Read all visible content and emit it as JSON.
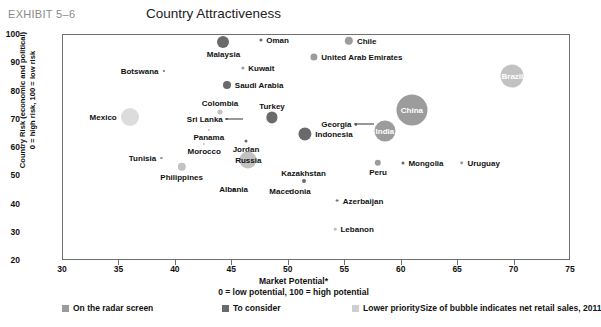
{
  "header": {
    "exhibit_id": "EXHIBIT 5–6",
    "title": "Country Attractiveness"
  },
  "chart_data": {
    "type": "scatter",
    "title": "Country Attractiveness",
    "xlabel": "Market Potential*",
    "xlabel_sub": "0 = low potential, 100 = high potential",
    "ylabel": "Country Risk (economic and political)",
    "ylabel_sub": "0 = high risk, 100 = low risk",
    "xlim": [
      30,
      75
    ],
    "ylim": [
      20,
      100
    ],
    "xticks": [
      30,
      35,
      40,
      45,
      50,
      55,
      60,
      65,
      70,
      75
    ],
    "yticks": [
      20,
      30,
      40,
      50,
      60,
      70,
      80,
      90,
      100
    ],
    "grid": false,
    "size_note": "Size of bubble indicates net retail sales, 2011",
    "legend": {
      "position": "bottom",
      "entries": [
        {
          "label": "On the radar screen",
          "color": "#9c9c9c"
        },
        {
          "label": "To consider",
          "color": "#6a6a6a"
        },
        {
          "label": "Lower priority",
          "color": "#cfcfcf"
        }
      ]
    },
    "points": [
      {
        "name": "Malaysia",
        "x": 44.3,
        "y": 97.0,
        "r": 6.0,
        "color": "#6a6a6a",
        "label_pos": "below",
        "label_inside": false
      },
      {
        "name": "Oman",
        "x": 47.6,
        "y": 97.8,
        "r": 1.6,
        "color": "#6a6a6a",
        "label_pos": "right",
        "label_inside": false
      },
      {
        "name": "Chile",
        "x": 55.4,
        "y": 97.5,
        "r": 4.2,
        "color": "#9c9c9c",
        "label_pos": "right",
        "label_inside": false
      },
      {
        "name": "United Arab Emirates",
        "x": 52.3,
        "y": 92.0,
        "r": 3.6,
        "color": "#9c9c9c",
        "label_pos": "right",
        "label_inside": false
      },
      {
        "name": "Kuwait",
        "x": 46.0,
        "y": 88.0,
        "r": 1.6,
        "color": "#9c9c9c",
        "label_pos": "right",
        "label_inside": false
      },
      {
        "name": "Botswana",
        "x": 39.0,
        "y": 86.8,
        "r": 1.1,
        "color": "#6a6a6a",
        "label_pos": "left",
        "label_inside": false
      },
      {
        "name": "Brazil",
        "x": 69.9,
        "y": 85.0,
        "r": 11.5,
        "color": "#c2c2c2",
        "label_pos": "center",
        "label_inside": true
      },
      {
        "name": "Saudi Arabia",
        "x": 44.6,
        "y": 82.0,
        "r": 4.0,
        "color": "#6a6a6a",
        "label_pos": "right",
        "label_inside": false
      },
      {
        "name": "Colombia",
        "x": 44.0,
        "y": 72.5,
        "r": 2.6,
        "color": "#c2c2c2",
        "label_pos": "above",
        "label_inside": false
      },
      {
        "name": "Mexico",
        "x": 36.0,
        "y": 70.5,
        "r": 9.0,
        "color": "#dcdcdc",
        "label_pos": "left",
        "label_inside": false
      },
      {
        "name": "Turkey",
        "x": 48.6,
        "y": 70.5,
        "r": 5.6,
        "color": "#6a6a6a",
        "label_pos": "above",
        "label_inside": false
      },
      {
        "name": "China",
        "x": 61.0,
        "y": 73.0,
        "r": 15.5,
        "color": "#9c9c9c",
        "label_pos": "center",
        "label_inside": true
      },
      {
        "name": "India",
        "x": 58.6,
        "y": 65.5,
        "r": 10.5,
        "color": "#9c9c9c",
        "label_pos": "center",
        "label_inside": true
      },
      {
        "name": "Sri Lanka",
        "x": 44.6,
        "y": 70.0,
        "r": 0.0,
        "color": "#6a6a6a",
        "label_pos": "leader",
        "label_inside": false
      },
      {
        "name": "Georgia",
        "x": 56.0,
        "y": 68.0,
        "r": 0.0,
        "color": "#6a6a6a",
        "label_pos": "leader",
        "label_inside": false
      },
      {
        "name": "Panama",
        "x": 43.0,
        "y": 66.0,
        "r": 0.0,
        "color": "#c2c2c2",
        "label_pos": "below",
        "label_inside": false
      },
      {
        "name": "Indonesia",
        "x": 51.5,
        "y": 64.5,
        "r": 6.6,
        "color": "#6a6a6a",
        "label_pos": "right",
        "label_inside": false
      },
      {
        "name": "Jordan",
        "x": 46.3,
        "y": 62.0,
        "r": 1.5,
        "color": "#6a6a6a",
        "label_pos": "below",
        "label_inside": false
      },
      {
        "name": "Morocco",
        "x": 42.6,
        "y": 61.0,
        "r": 0.0,
        "color": "#c2c2c2",
        "label_pos": "below",
        "label_inside": false
      },
      {
        "name": "Tunisia",
        "x": 38.8,
        "y": 56.0,
        "r": 1.1,
        "color": "#9c9c9c",
        "label_pos": "left",
        "label_inside": false
      },
      {
        "name": "Russia",
        "x": 46.5,
        "y": 55.5,
        "r": 8.6,
        "color": "#c2c2c2",
        "label_pos": "center",
        "label_inside": false
      },
      {
        "name": "Peru",
        "x": 58.0,
        "y": 54.5,
        "r": 3.2,
        "color": "#9c9c9c",
        "label_pos": "below",
        "label_inside": false
      },
      {
        "name": "Mongolia",
        "x": 60.2,
        "y": 54.5,
        "r": 1.5,
        "color": "#6a6a6a",
        "label_pos": "right",
        "label_inside": false
      },
      {
        "name": "Uruguay",
        "x": 65.4,
        "y": 54.5,
        "r": 1.8,
        "color": "#9c9c9c",
        "label_pos": "right",
        "label_inside": false
      },
      {
        "name": "Philippines",
        "x": 40.6,
        "y": 53.0,
        "r": 4.2,
        "color": "#c2c2c2",
        "label_pos": "below",
        "label_inside": false
      },
      {
        "name": "Kazakhstan",
        "x": 51.4,
        "y": 48.0,
        "r": 2.0,
        "color": "#6a6a6a",
        "label_pos": "above",
        "label_inside": false
      },
      {
        "name": "Albania",
        "x": 45.2,
        "y": 45.0,
        "r": 0.0,
        "color": "#6a6a6a",
        "label_pos": "center",
        "label_inside": false
      },
      {
        "name": "Macedonia",
        "x": 50.2,
        "y": 44.5,
        "r": 0.0,
        "color": "#6a6a6a",
        "label_pos": "center",
        "label_inside": false
      },
      {
        "name": "Azerbaijan",
        "x": 54.4,
        "y": 41.0,
        "r": 1.4,
        "color": "#6a6a6a",
        "label_pos": "right",
        "label_inside": false
      },
      {
        "name": "Lebanon",
        "x": 54.2,
        "y": 31.0,
        "r": 1.3,
        "color": "#c2c2c2",
        "label_pos": "right",
        "label_inside": false
      }
    ]
  }
}
